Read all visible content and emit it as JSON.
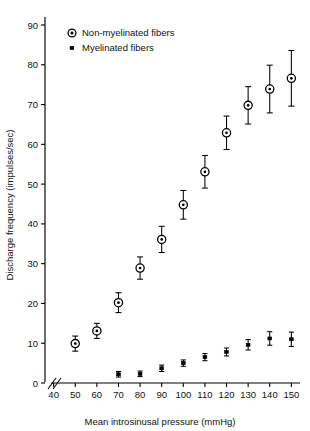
{
  "chart_data": {
    "type": "scatter",
    "title": "",
    "xlabel": "Mean introsinusal pressure (mmHg)",
    "ylabel": "Discharge frequency (impulses/sec)",
    "xlim": [
      35,
      155
    ],
    "ylim": [
      0,
      92
    ],
    "x_ticks": [
      40,
      50,
      60,
      70,
      80,
      90,
      100,
      110,
      120,
      130,
      140,
      150
    ],
    "y_ticks": [
      0,
      10,
      20,
      30,
      40,
      50,
      60,
      70,
      80,
      90
    ],
    "grid": false,
    "axis_break_x": true,
    "legend_position": "top-left",
    "error_bars": "symmetric",
    "series": [
      {
        "name": "Non-myelinated fibers",
        "marker": "circle-dot",
        "x": [
          50,
          60,
          70,
          80,
          90,
          100,
          110,
          120,
          130,
          140,
          150
        ],
        "values": [
          9.9,
          13.1,
          20.2,
          28.9,
          36.1,
          44.8,
          53.1,
          62.9,
          69.8,
          73.9,
          76.6
        ],
        "errors": [
          1.9,
          1.9,
          2.5,
          2.8,
          3.3,
          3.6,
          4.1,
          4.2,
          4.7,
          6.0,
          7.0
        ]
      },
      {
        "name": "Myelinated fibers",
        "marker": "dot",
        "x": [
          70,
          80,
          90,
          100,
          110,
          120,
          130,
          140,
          150
        ],
        "values": [
          2.2,
          2.3,
          3.7,
          5.0,
          6.5,
          7.8,
          9.6,
          11.2,
          11.0
        ],
        "errors": [
          0.7,
          0.7,
          0.8,
          0.8,
          0.9,
          1.0,
          1.3,
          1.7,
          1.8
        ]
      }
    ]
  },
  "legend": {
    "entries": [
      {
        "label": "Non-myelinated fibers",
        "marker": "circle-dot-icon"
      },
      {
        "label": "Myelinated fibers",
        "marker": "dot-icon"
      }
    ]
  },
  "axes": {
    "x_title": "Mean introsinusal pressure (mmHg)",
    "y_title": "Discharge frequency (impulses/sec)",
    "x_tick_labels": [
      "40",
      "50",
      "60",
      "70",
      "80",
      "90",
      "100",
      "110",
      "120",
      "130",
      "140",
      "150"
    ],
    "y_tick_labels": [
      "0",
      "10",
      "20",
      "30",
      "40",
      "50",
      "60",
      "70",
      "80",
      "90"
    ]
  },
  "colors": {
    "axis": "#000000",
    "marker_fill": "#ffffff",
    "marker_edge": "#000000",
    "background": "#ffffff"
  }
}
